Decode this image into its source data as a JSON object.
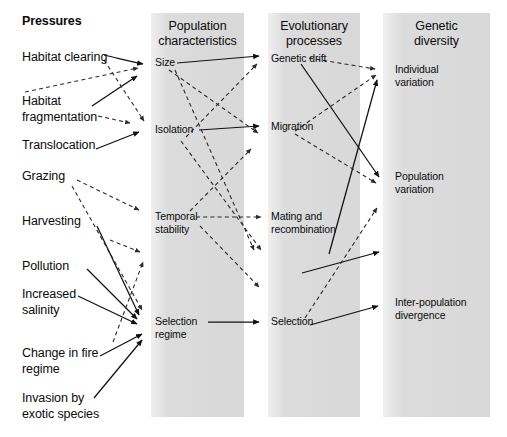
{
  "figure": {
    "kind": "flow-diagram",
    "background_color": "#ffffff",
    "band_color": "#d9d9d9",
    "line_color": "#111111"
  },
  "sections": {
    "pressures_title": "Pressures"
  },
  "columns": [
    {
      "id": "population-characteristics",
      "heading": "Population\ncharacteristics"
    },
    {
      "id": "evolutionary-processes",
      "heading": "Evolutionary\nprocesses"
    },
    {
      "id": "genetic-diversity",
      "heading": "Genetic\ndiversity"
    }
  ],
  "pressures": [
    {
      "id": "habitat-clearing",
      "label": "Habitat clearing"
    },
    {
      "id": "habitat-fragmentation",
      "label": "Habitat\nfragmentation"
    },
    {
      "id": "translocation",
      "label": "Translocation"
    },
    {
      "id": "grazing",
      "label": "Grazing"
    },
    {
      "id": "harvesting",
      "label": "Harvesting"
    },
    {
      "id": "pollution",
      "label": "Pollution"
    },
    {
      "id": "increased-salinity",
      "label": "Increased\nsalinity"
    },
    {
      "id": "change-in-fire-regime",
      "label": "Change in fire\nregime"
    },
    {
      "id": "invasion-by-exotic-species",
      "label": "Invasion by\nexotic species"
    }
  ],
  "population_characteristics": [
    {
      "id": "size",
      "label": "Size"
    },
    {
      "id": "isolation",
      "label": "Isolation"
    },
    {
      "id": "temporal-stability",
      "label": "Temporal\nstability"
    },
    {
      "id": "selection-regime",
      "label": "Selection\nregime"
    }
  ],
  "evolutionary_processes": [
    {
      "id": "genetic-drift",
      "label": "Genetic drift"
    },
    {
      "id": "migration",
      "label": "Migration"
    },
    {
      "id": "mating-and-recombination",
      "label": "Mating and\nrecombination"
    },
    {
      "id": "selection",
      "label": "Selection"
    }
  ],
  "genetic_diversity": [
    {
      "id": "individual-variation",
      "label": "Individual\nvariation"
    },
    {
      "id": "population-variation",
      "label": "Population\nvariation"
    },
    {
      "id": "inter-population-divergence",
      "label": "Inter-population\ndivergence"
    }
  ]
}
